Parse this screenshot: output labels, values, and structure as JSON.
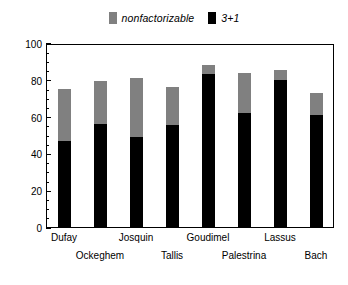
{
  "chart_data": {
    "type": "bar",
    "subtype": "stacked",
    "title": "",
    "xlabel": "",
    "ylabel": "Percent of total",
    "ylim": [
      0,
      100
    ],
    "yticks": [
      0,
      20,
      40,
      60,
      80,
      100
    ],
    "ytick_labels": [
      "0",
      "20",
      "40",
      "60",
      "80",
      "100"
    ],
    "grid": false,
    "legend_position": "top-center",
    "categories": [
      "Dufay",
      "Ockeghem",
      "Josquin",
      "Tallis",
      "Goudimel",
      "Palestrina",
      "Lassus",
      "Bach"
    ],
    "series": [
      {
        "name": "3+1",
        "color": "#000000",
        "values": [
          47.5,
          56.5,
          49.5,
          56.0,
          83.5,
          62.5,
          80.5,
          61.5
        ]
      },
      {
        "name": "nonfactorizable",
        "color": "#808080",
        "values": [
          28.0,
          23.5,
          32.0,
          20.5,
          5.0,
          22.0,
          5.5,
          12.0
        ]
      }
    ],
    "totals": [
      75.5,
      80.0,
      81.5,
      76.5,
      88.5,
      84.5,
      86.0,
      73.5
    ]
  },
  "legend": {
    "items": [
      {
        "label": "nonfactorizable",
        "color": "#808080",
        "swatch": "legend-swatch-gray"
      },
      {
        "label": "3+1",
        "color": "#000000",
        "swatch": "legend-swatch-black"
      }
    ]
  },
  "axes": {
    "y_title": "Percent of total",
    "y_ticks": [
      "100",
      "80",
      "60",
      "40",
      "20",
      "0"
    ],
    "x_categories": [
      "Dufay",
      "Ockeghem",
      "Josquin",
      "Tallis",
      "Goudimel",
      "Palestrina",
      "Lassus",
      "Bach"
    ]
  },
  "colors": {
    "black": "#000000",
    "gray": "#808080",
    "axis": "#000000",
    "background": "#ffffff"
  }
}
